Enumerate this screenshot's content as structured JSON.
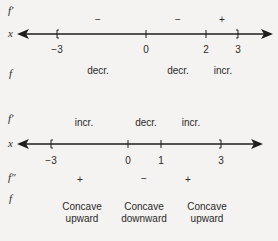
{
  "diagram1": {
    "row_labels": {
      "fprime": "f′",
      "x": "x",
      "f": "f"
    },
    "ticks": [
      {
        "label": "−3",
        "x": 57,
        "mark": "["
      },
      {
        "label": "0",
        "x": 146,
        "mark": "|"
      },
      {
        "label": "2",
        "x": 206,
        "mark": "|"
      },
      {
        "label": "3",
        "x": 238,
        "mark": "]"
      }
    ],
    "fprime_signs": [
      {
        "text": "−",
        "x": 98
      },
      {
        "text": "−",
        "x": 178
      },
      {
        "text": "+",
        "x": 222
      }
    ],
    "f_behavior": [
      {
        "text": "decr.",
        "x": 98
      },
      {
        "text": "decr.",
        "x": 178
      },
      {
        "text": "incr.",
        "x": 223
      }
    ]
  },
  "diagram2": {
    "row_labels": {
      "fprime": "f′",
      "x": "x",
      "fdoubleprime": "f″",
      "f": "f"
    },
    "ticks": [
      {
        "label": "−3",
        "x": 51,
        "mark": "["
      },
      {
        "label": "0",
        "x": 128,
        "mark": "|"
      },
      {
        "label": "1",
        "x": 161,
        "mark": "|"
      },
      {
        "label": "3",
        "x": 221,
        "mark": "]"
      }
    ],
    "fprime_behavior": [
      {
        "text": "incr.",
        "x": 84
      },
      {
        "text": "decr.",
        "x": 146
      },
      {
        "text": "incr.",
        "x": 191
      }
    ],
    "fdoubleprime_signs": [
      {
        "text": "+",
        "x": 80
      },
      {
        "text": "−",
        "x": 144
      },
      {
        "text": "+",
        "x": 188
      }
    ],
    "f_concavity": [
      {
        "line1": "Concave",
        "line2": "upward",
        "x": 82
      },
      {
        "line1": "Concave",
        "line2": "downward",
        "x": 144
      },
      {
        "line1": "Concave",
        "line2": "upward",
        "x": 207
      }
    ]
  }
}
